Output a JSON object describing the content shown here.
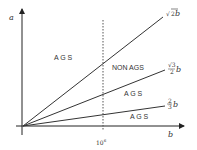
{
  "diagram": {
    "axes": {
      "y_label": "a",
      "x_label": "b",
      "x_tick_label": "10",
      "x_tick_exponent": "6"
    },
    "lines": [
      {
        "name": "sqrt2-b",
        "label_radical": "√",
        "label_radicand": "2",
        "label_var": "b"
      },
      {
        "name": "sqrt3-over-2-b",
        "label_num": "√3",
        "label_den": "2",
        "label_var": "b"
      },
      {
        "name": "two-thirds-b",
        "label_num": "2",
        "label_den": "3",
        "label_var": "b"
      }
    ],
    "regions": [
      {
        "name": "ags-upper",
        "label": "A G S"
      },
      {
        "name": "non-ags",
        "label": "NON AGS"
      },
      {
        "name": "ags-middle",
        "label": "A G S"
      },
      {
        "name": "ags-lower",
        "label": "A G S"
      }
    ],
    "colors": {
      "axis": "#222222",
      "line": "#333333",
      "dashed": "#555555",
      "text": "#333333"
    }
  }
}
